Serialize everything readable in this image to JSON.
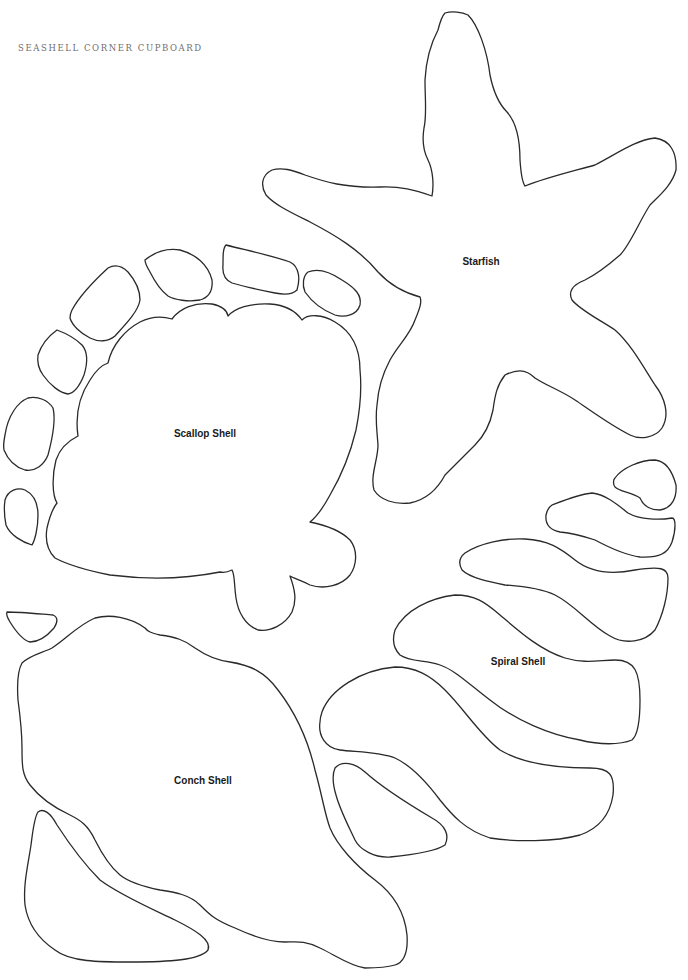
{
  "header": {
    "title": "SEASHELL CORNER CUPBOARD"
  },
  "stroke_color": "#2a2a2a",
  "background_color": "#ffffff",
  "shapes": {
    "starfish": {
      "label": "Starfish"
    },
    "scallop": {
      "label": "Scallop Shell"
    },
    "spiral": {
      "label": "Spiral Shell"
    },
    "conch": {
      "label": "Conch Shell"
    }
  }
}
